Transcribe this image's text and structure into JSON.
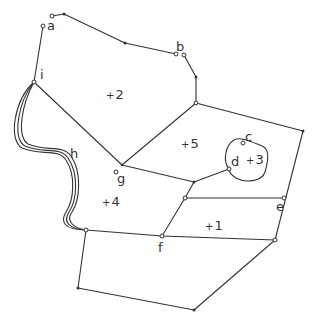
{
  "diagram": {
    "type": "planar-graph",
    "stroke_color": "#333333",
    "vertex_labels": [
      {
        "id": "a",
        "text": "a",
        "x": 47,
        "y": 19
      },
      {
        "id": "b",
        "text": "b",
        "x": 176,
        "y": 40
      },
      {
        "id": "c",
        "text": "c",
        "x": 245,
        "y": 130
      },
      {
        "id": "d",
        "text": "d",
        "x": 231,
        "y": 155
      },
      {
        "id": "e",
        "text": "e",
        "x": 276,
        "y": 200
      },
      {
        "id": "f",
        "text": "f",
        "x": 158,
        "y": 241
      },
      {
        "id": "g",
        "text": "g",
        "x": 117,
        "y": 172
      },
      {
        "id": "h",
        "text": "h",
        "x": 70,
        "y": 147
      },
      {
        "id": "i",
        "text": "i",
        "x": 40,
        "y": 68
      }
    ],
    "face_labels": [
      {
        "id": "1",
        "text": "1",
        "x": 205,
        "y": 219
      },
      {
        "id": "2",
        "text": "2",
        "x": 106,
        "y": 88
      },
      {
        "id": "3",
        "text": "3",
        "x": 248,
        "y": 153
      },
      {
        "id": "4",
        "text": "4",
        "x": 104,
        "y": 195
      },
      {
        "id": "5",
        "text": "5",
        "x": 183,
        "y": 137
      }
    ]
  }
}
